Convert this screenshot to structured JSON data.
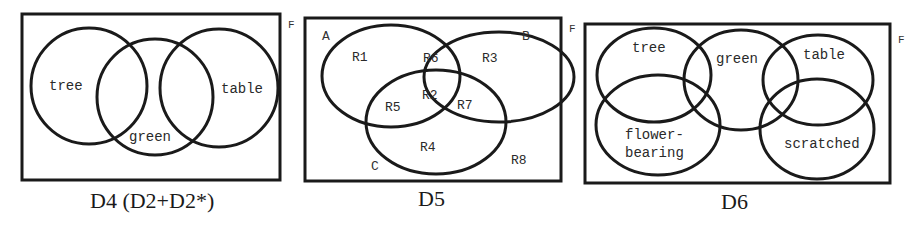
{
  "diagrams": [
    {
      "id": "D4",
      "caption": "D4 (D2+D2*)",
      "frame_label": "F",
      "sets": [
        {
          "name": "tree",
          "label": "tree"
        },
        {
          "name": "green",
          "label": "green"
        },
        {
          "name": "table",
          "label": "table"
        }
      ]
    },
    {
      "id": "D5",
      "caption": "D5",
      "frame_label": "F",
      "set_labels": [
        "A",
        "B",
        "C"
      ],
      "regions": [
        "R1",
        "R2",
        "R3",
        "R4",
        "R5",
        "R6",
        "R7",
        "R8"
      ]
    },
    {
      "id": "D6",
      "caption": "D6",
      "frame_label": "F",
      "sets": [
        {
          "name": "tree",
          "label": "tree"
        },
        {
          "name": "green",
          "label": "green"
        },
        {
          "name": "table",
          "label": "table"
        },
        {
          "name": "flower-bearing",
          "label_line1": "flower-",
          "label_line2": "bearing"
        },
        {
          "name": "scratched",
          "label": "scratched"
        }
      ]
    }
  ]
}
